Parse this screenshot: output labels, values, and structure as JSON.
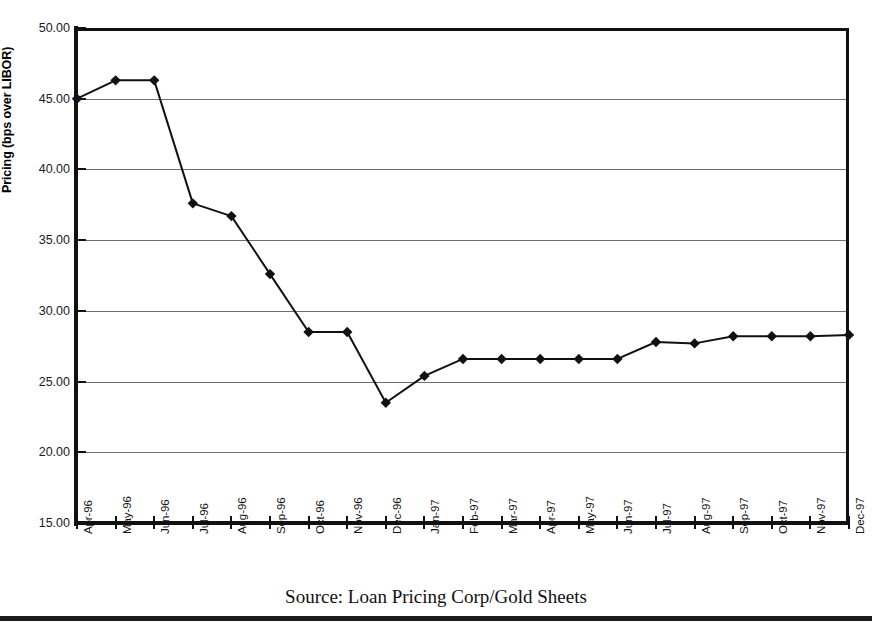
{
  "caption": "Source: Loan Pricing Corp/Gold Sheets",
  "colors": {
    "line": "#111111",
    "marker": "#111111",
    "grid": "#6f6f6f",
    "axis": "#111111",
    "background": "#ffffff"
  },
  "chart_data": {
    "type": "line",
    "title": "",
    "subtitle": "",
    "xlabel": "",
    "ylabel": "Pricing (bps over LIBOR)",
    "ylim": [
      15.0,
      50.0
    ],
    "ytick_labels": [
      "50.00",
      "45.00",
      "40.00",
      "35.00",
      "30.00",
      "25.00",
      "20.00",
      "15.00"
    ],
    "yticks": [
      50.0,
      45.0,
      40.0,
      35.0,
      30.0,
      25.0,
      20.0,
      15.0
    ],
    "grid": true,
    "grid_axis": "y",
    "legend": false,
    "legend_position": "none",
    "marker": "diamond",
    "categories": [
      "Apr-96",
      "May-96",
      "Jun-96",
      "Jul-96",
      "Aug-96",
      "Sep-96",
      "Oct-96",
      "Nov-96",
      "Dec-96",
      "Jan-97",
      "Feb-97",
      "Mar-97",
      "Apr-97",
      "May-97",
      "Jun-97",
      "Jul-97",
      "Aug-97",
      "Sep-97",
      "Oct-97",
      "Nov-97",
      "Dec-97"
    ],
    "values": [
      45.0,
      46.3,
      46.3,
      37.6,
      36.7,
      32.6,
      28.5,
      28.5,
      23.5,
      25.4,
      26.6,
      26.6,
      26.6,
      26.6,
      26.6,
      27.8,
      27.7,
      28.2,
      28.2,
      28.2,
      28.3
    ],
    "series": [
      {
        "name": "Pricing (bps over LIBOR)",
        "values": [
          45.0,
          46.3,
          46.3,
          37.6,
          36.7,
          32.6,
          28.5,
          28.5,
          23.5,
          25.4,
          26.6,
          26.6,
          26.6,
          26.6,
          26.6,
          27.8,
          27.7,
          28.2,
          28.2,
          28.2,
          28.3
        ]
      }
    ]
  }
}
